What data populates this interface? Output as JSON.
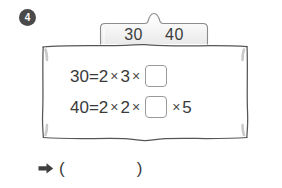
{
  "problem": {
    "number": "4",
    "number_icon": "circled-number-badge"
  },
  "tab": {
    "icon": "tab-bump-shape",
    "values": [
      "30",
      "40"
    ]
  },
  "equations": [
    {
      "id": "equation-30",
      "left": "30",
      "equals": "=",
      "terms": [
        "2",
        "3"
      ],
      "operator": "×",
      "blank": "",
      "trailing_terms": []
    },
    {
      "id": "equation-40",
      "left": "40",
      "equals": "=",
      "terms": [
        "2",
        "2"
      ],
      "operator": "×",
      "blank": "",
      "trailing_terms": [
        "5"
      ]
    }
  ],
  "answer_row": {
    "arrow_icon": "right-arrow-icon",
    "paren_open": "(",
    "paren_close": ")",
    "answer_value": ""
  },
  "colors": {
    "ink": "#3a3a3a",
    "badge_bg": "#4a4a4a",
    "badge_text": "#ffffff",
    "box_border": "#9a9a9a",
    "panel_border": "#545454",
    "tab_fill": "#f2f2f2",
    "page_bg": "#ffffff"
  }
}
